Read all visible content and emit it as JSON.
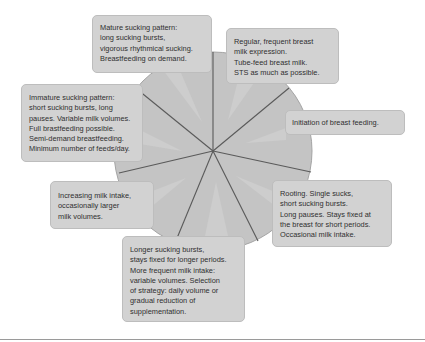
{
  "diagram": {
    "type": "circular-stage-diagram",
    "colors": {
      "circle_fill": "#c4c4c4",
      "circle_stroke": "#9e9e9e",
      "spoke": "#5a5a5a",
      "callout_fill": "#d2d2d2",
      "pointer_fill": "#cbcbcb",
      "text": "#2f2f2f",
      "bottom_rule": "#9a9a9a"
    },
    "callouts": [
      {
        "id": "mature",
        "text": "Mature sucking pattern:\nlong sucking bursts,\nvigorous rhythmical sucking.\nBreastfeeding on demand."
      },
      {
        "id": "regular",
        "text": "Regular, frequent breast\nmilk expression.\nTube-feed breast milk.\nSTS as much as possible."
      },
      {
        "id": "initiation",
        "text": "Initiation of breast feeding."
      },
      {
        "id": "rooting",
        "text": "Rooting. Single sucks,\nshort sucking bursts.\nLong pauses. Stays fixed at\nthe breast for short periods.\nOccasional milk intake."
      },
      {
        "id": "longer",
        "text": "Longer sucking bursts,\nstays fixed for longer periods.\nMore frequent milk intake:\nvariable volumes. Selection\nof strategy: daily volume or\ngradual reduction of\nsupplementation."
      },
      {
        "id": "increasing",
        "text": "Increasing milk intake,\noccasionally larger\nmilk volumes."
      },
      {
        "id": "immature",
        "text": "Immature sucking pattern:\nshort sucking bursts, long\npauses. Variable milk volumes.\nFull brastfeeding possible.\nSemi-demand breastfeeding.\nMinimum number of feeds/day."
      }
    ]
  }
}
